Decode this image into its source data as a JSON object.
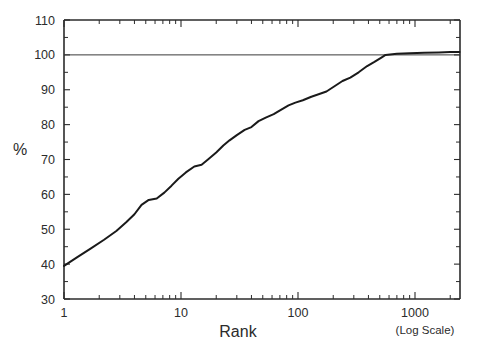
{
  "chart_data": {
    "type": "line",
    "title": "",
    "xlabel": "Rank",
    "xlabel_note": "(Log Scale)",
    "ylabel": "%",
    "xscale": "log",
    "yscale": "linear",
    "xlim": [
      1,
      2400
    ],
    "ylim": [
      30,
      110
    ],
    "grid": false,
    "legend": null,
    "ytick_labels": [
      "30",
      "40",
      "50",
      "60",
      "70",
      "80",
      "90",
      "100",
      "110"
    ],
    "ytick_values": [
      30,
      40,
      50,
      60,
      70,
      80,
      90,
      100,
      110
    ],
    "yminor_step": 5,
    "xtick_labels": [
      "1",
      "10",
      "100",
      "1000"
    ],
    "xtick_values": [
      1,
      10,
      100,
      1000
    ],
    "annotations": [
      {
        "label": "100% reference line",
        "type": "horizontal-line",
        "y": 100
      }
    ],
    "series": [
      {
        "name": "cumulative-percent",
        "x": [
          1,
          1.3,
          1.7,
          2.2,
          2.8,
          3.4,
          4.0,
          4.6,
          5.3,
          6.2,
          7.2,
          8.3,
          9.5,
          11,
          13,
          15,
          17,
          20,
          23,
          26,
          30,
          35,
          40,
          46,
          53,
          62,
          72,
          83,
          95,
          110,
          130,
          150,
          175,
          205,
          240,
          280,
          330,
          390,
          450,
          520,
          560,
          700,
          900,
          1200,
          1600,
          2000,
          2400
        ],
        "y": [
          39.5,
          42.0,
          44.5,
          47.0,
          49.5,
          52.0,
          54.3,
          57.0,
          58.4,
          58.8,
          60.5,
          62.5,
          64.5,
          66.3,
          68.0,
          68.5,
          70.0,
          72.0,
          74.0,
          75.5,
          77.0,
          78.5,
          79.3,
          81.0,
          82.0,
          83.0,
          84.3,
          85.5,
          86.3,
          87.0,
          88.0,
          88.7,
          89.5,
          91.0,
          92.5,
          93.5,
          95.0,
          96.8,
          98.0,
          99.3,
          100.0,
          100.3,
          100.5,
          100.6,
          100.7,
          100.8,
          100.8
        ]
      }
    ]
  },
  "axes": {
    "y_axis_label": "%",
    "x_axis_label": "Rank",
    "x_axis_scale_note": "(Log Scale)"
  }
}
